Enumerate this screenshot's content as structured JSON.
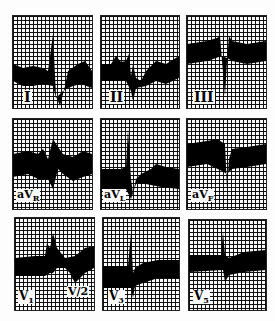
{
  "figure": {
    "type": "12-lead ECG strips (9 panels)",
    "panels": [
      {
        "lead": "I",
        "label": "I",
        "sub": ""
      },
      {
        "lead": "II",
        "label": "II",
        "sub": ""
      },
      {
        "lead": "III",
        "label": "III",
        "sub": ""
      },
      {
        "lead": "aVR",
        "label": "aV",
        "sub": "R"
      },
      {
        "lead": "aVL",
        "label": "aV",
        "sub": "L"
      },
      {
        "lead": "aVF",
        "label": "aV",
        "sub": "F"
      },
      {
        "lead": "V1",
        "label": "V",
        "sub": "1",
        "extra_label": "V/2"
      },
      {
        "lead": "V3",
        "label": "V",
        "sub": "3"
      },
      {
        "lead": "V5",
        "label": "V",
        "sub": "5"
      }
    ]
  }
}
